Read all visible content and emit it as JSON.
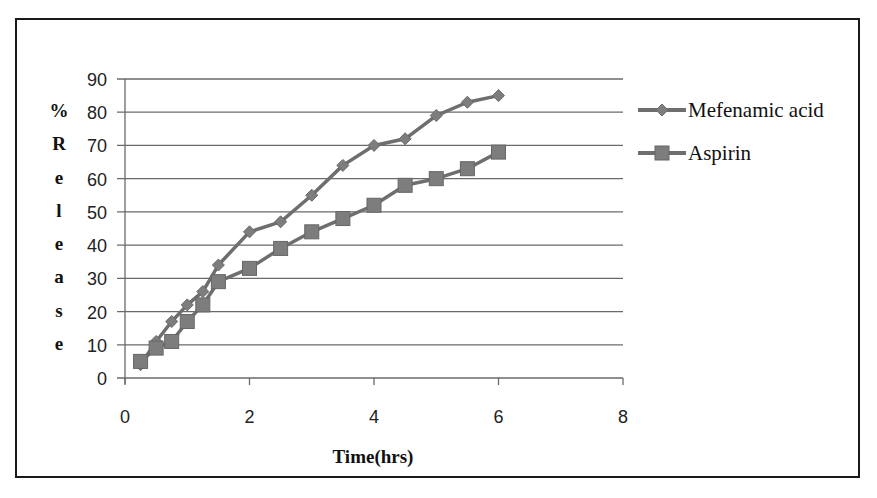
{
  "chart_data": {
    "type": "line",
    "title": "",
    "xlabel": "Time(hrs)",
    "ylabel": "% Release",
    "ylabel_chars": [
      "%",
      "R",
      "e",
      "l",
      "e",
      "a",
      "s",
      "e"
    ],
    "xlim": [
      0,
      8
    ],
    "ylim": [
      0,
      90
    ],
    "x_ticks": [
      0,
      2,
      4,
      6,
      8
    ],
    "y_ticks": [
      0,
      10,
      20,
      30,
      40,
      50,
      60,
      70,
      80,
      90
    ],
    "grid": "horizontal",
    "legend_position": "right",
    "x": [
      0.25,
      0.5,
      0.75,
      1,
      1.25,
      1.5,
      2,
      2.5,
      3,
      3.5,
      4,
      4.5,
      5,
      5.5,
      6
    ],
    "series": [
      {
        "name": "Mefenamic acid",
        "marker": "diamond",
        "color": "#6e6e6e",
        "values": [
          4,
          11,
          17,
          22,
          26,
          34,
          44,
          47,
          55,
          64,
          70,
          72,
          79,
          83,
          85
        ]
      },
      {
        "name": "Aspirin",
        "marker": "square",
        "color": "#6e6e6e",
        "values": [
          5,
          9,
          11,
          17,
          22,
          29,
          33,
          39,
          44,
          48,
          52,
          58,
          60,
          63,
          68
        ]
      }
    ]
  }
}
